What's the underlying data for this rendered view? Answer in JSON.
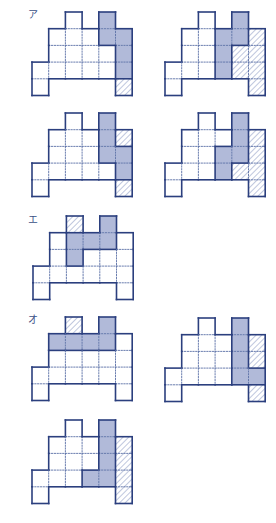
{
  "colors": {
    "outline": "#2b3f7e",
    "dotted": "#5a6fa6",
    "blue_fill": "#b1bad9",
    "hatch": "#7f8fbd",
    "background": "#ffffff"
  },
  "grid": {
    "cell_size": 16.7,
    "cells": [
      [
        2,
        0
      ],
      [
        4,
        0
      ],
      [
        1,
        1
      ],
      [
        2,
        1
      ],
      [
        3,
        1
      ],
      [
        4,
        1
      ],
      [
        5,
        1
      ],
      [
        1,
        2
      ],
      [
        2,
        2
      ],
      [
        3,
        2
      ],
      [
        4,
        2
      ],
      [
        5,
        2
      ],
      [
        0,
        3
      ],
      [
        1,
        3
      ],
      [
        2,
        3
      ],
      [
        3,
        3
      ],
      [
        4,
        3
      ],
      [
        5,
        3
      ],
      [
        0,
        4
      ],
      [
        5,
        4
      ]
    ]
  },
  "labels": [
    {
      "id": "label-a",
      "text": "ア",
      "x": 28,
      "y": 10
    },
    {
      "id": "label-e",
      "text": "エ",
      "x": 28,
      "y": 215
    },
    {
      "id": "label-o",
      "text": "オ",
      "x": 28,
      "y": 315
    }
  ],
  "figures": [
    {
      "name": "figure-a-1",
      "x": 32,
      "y": 12,
      "blue": [
        [
          4,
          0
        ],
        [
          4,
          1
        ],
        [
          5,
          1
        ],
        [
          5,
          2
        ],
        [
          5,
          3
        ]
      ],
      "hatched": [
        [
          5,
          4
        ]
      ]
    },
    {
      "name": "figure-a-2",
      "x": 165,
      "y": 12,
      "blue": [
        [
          3,
          1
        ],
        [
          3,
          2
        ],
        [
          3,
          3
        ],
        [
          4,
          0
        ],
        [
          4,
          1
        ]
      ],
      "hatched": [
        [
          4,
          2
        ],
        [
          4,
          3
        ],
        [
          5,
          1
        ],
        [
          5,
          2
        ],
        [
          5,
          3
        ],
        [
          5,
          4
        ]
      ]
    },
    {
      "name": "figure-3",
      "x": 32,
      "y": 113,
      "blue": [
        [
          4,
          0
        ],
        [
          4,
          1
        ],
        [
          4,
          2
        ],
        [
          5,
          2
        ],
        [
          5,
          3
        ]
      ],
      "hatched": [
        [
          5,
          1
        ],
        [
          5,
          4
        ]
      ]
    },
    {
      "name": "figure-4",
      "x": 165,
      "y": 113,
      "blue": [
        [
          4,
          0
        ],
        [
          4,
          1
        ],
        [
          4,
          2
        ],
        [
          3,
          2
        ],
        [
          3,
          3
        ]
      ],
      "hatched": [
        [
          4,
          3
        ],
        [
          5,
          1
        ],
        [
          5,
          2
        ],
        [
          5,
          3
        ],
        [
          5,
          4
        ]
      ]
    },
    {
      "name": "figure-e",
      "x": 33,
      "y": 216,
      "blue": [
        [
          2,
          1
        ],
        [
          2,
          2
        ],
        [
          3,
          1
        ],
        [
          4,
          0
        ],
        [
          4,
          1
        ]
      ],
      "hatched": [
        [
          2,
          0
        ]
      ]
    },
    {
      "name": "figure-o-1",
      "x": 32,
      "y": 317,
      "blue": [
        [
          1,
          1
        ],
        [
          2,
          1
        ],
        [
          3,
          1
        ],
        [
          4,
          1
        ],
        [
          4,
          0
        ]
      ],
      "hatched": [
        [
          2,
          0
        ]
      ]
    },
    {
      "name": "figure-o-2",
      "x": 165,
      "y": 318,
      "blue": [
        [
          4,
          0
        ],
        [
          4,
          1
        ],
        [
          4,
          2
        ],
        [
          4,
          3
        ],
        [
          5,
          3
        ]
      ],
      "hatched": [
        [
          5,
          1
        ],
        [
          5,
          2
        ],
        [
          5,
          4
        ]
      ]
    },
    {
      "name": "figure-7",
      "x": 32,
      "y": 420,
      "blue": [
        [
          4,
          0
        ],
        [
          4,
          1
        ],
        [
          4,
          2
        ],
        [
          4,
          3
        ],
        [
          3,
          3
        ]
      ],
      "hatched": [
        [
          5,
          1
        ],
        [
          5,
          2
        ],
        [
          5,
          3
        ],
        [
          5,
          4
        ]
      ]
    }
  ]
}
